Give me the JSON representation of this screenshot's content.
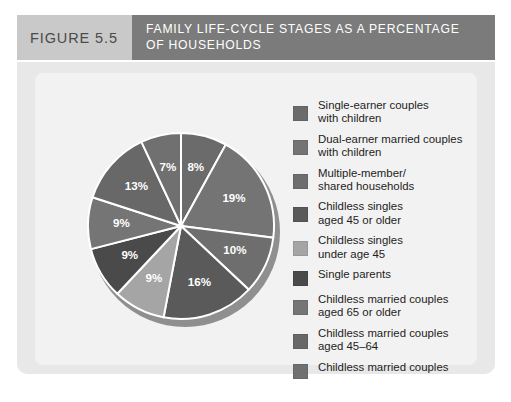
{
  "figure": {
    "number_label": "FIGURE 5.5",
    "title_line1": "FAMILY LIFE-CYCLE STAGES AS A PERCENTAGE",
    "title_line2": "OF HOUSEHOLDS"
  },
  "colors": {
    "header_number_bg": "#c9c9c9",
    "header_title_bg": "#7b7b7b",
    "panel_bg": "#e8e8e8",
    "panel_inner_bg": "#f2f2f2",
    "label_text": "#ffffff"
  },
  "chart_data": {
    "type": "pie",
    "title": "FAMILY LIFE-CYCLE STAGES AS A PERCENTAGE OF HOUSEHOLDS",
    "unit": "%",
    "start_angle_deg": 0,
    "direction": "clockwise",
    "legend_position": "right",
    "grid": false,
    "categories": [
      "Single-earner couples with children",
      "Dual-earner married couples with children",
      "Multiple-member/ shared households",
      "Childless singles aged 45 or older",
      "Childless singles under age 45",
      "Single parents",
      "Childless married couples aged 65 or older",
      "Childless married couples aged 45–64",
      "Childless married couples"
    ],
    "values": [
      8,
      19,
      10,
      16,
      9,
      9,
      9,
      13,
      7
    ],
    "labels": [
      "8%",
      "19%",
      "10%",
      "16%",
      "9%",
      "9%",
      "9%",
      "13%",
      "7%"
    ],
    "slice_colors": [
      "#6b6b6b",
      "#747474",
      "#6e6e6e",
      "#5a5a5a",
      "#a5a5a5",
      "#4a4a4a",
      "#757575",
      "#686868",
      "#707070"
    ]
  },
  "legend": {
    "items": [
      {
        "label": "Single-earner couples\nwith children",
        "color": "#6b6b6b",
        "value": "8%"
      },
      {
        "label": "Dual-earner married couples\nwith children",
        "color": "#747474",
        "value": "19%"
      },
      {
        "label": "Multiple-member/\nshared households",
        "color": "#6e6e6e",
        "value": "10%"
      },
      {
        "label": "Childless singles\naged 45 or older",
        "color": "#5a5a5a",
        "value": "16%"
      },
      {
        "label": "Childless singles\nunder age 45",
        "color": "#a5a5a5",
        "value": "9%"
      },
      {
        "label": "Single parents",
        "color": "#4a4a4a",
        "value": "9%"
      },
      {
        "label": "Childless married couples\naged 65 or older",
        "color": "#757575",
        "value": "9%"
      },
      {
        "label": "Childless married couples\naged 45–64",
        "color": "#686868",
        "value": "13%"
      },
      {
        "label": "Childless married couples",
        "color": "#707070",
        "value": "7%"
      }
    ]
  }
}
